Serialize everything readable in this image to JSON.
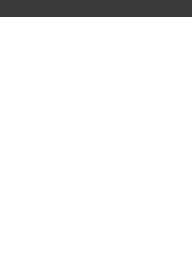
{
  "fret_label": "8 fr",
  "grid": {
    "strings_x": [
      21,
      50,
      79,
      108,
      137,
      166
    ],
    "frets_y": [
      41,
      84,
      122,
      161,
      199,
      235
    ],
    "line_color": "#666666"
  },
  "banner_color": "#3a3a3a",
  "markers": [
    {
      "fret": 1,
      "string": 1,
      "type": "dot"
    },
    {
      "fret": 1,
      "string": 4,
      "type": "dot"
    },
    {
      "fret": 1,
      "string": 5,
      "type": "dot"
    },
    {
      "fret": 1,
      "string": 6,
      "type": "dot"
    },
    {
      "fret": 2,
      "string": 2,
      "type": "dot"
    },
    {
      "fret": 2,
      "string": 3,
      "type": "dot"
    },
    {
      "fret": 2,
      "string": 4,
      "type": "square"
    },
    {
      "fret": 3,
      "string": 2,
      "type": "dot"
    },
    {
      "fret": 3,
      "string": 3,
      "type": "dot"
    },
    {
      "fret": 3,
      "string": 5,
      "type": "dot"
    },
    {
      "fret": 4,
      "string": 1,
      "type": "dot"
    },
    {
      "fret": 4,
      "string": 4,
      "type": "dot"
    },
    {
      "fret": 4,
      "string": 6,
      "type": "dot"
    },
    {
      "fret": 5,
      "string": 1,
      "type": "square"
    },
    {
      "fret": 5,
      "string": 2,
      "type": "dot"
    },
    {
      "fret": 5,
      "string": 5,
      "type": "dot"
    },
    {
      "fret": 5,
      "string": 6,
      "type": "square"
    }
  ]
}
